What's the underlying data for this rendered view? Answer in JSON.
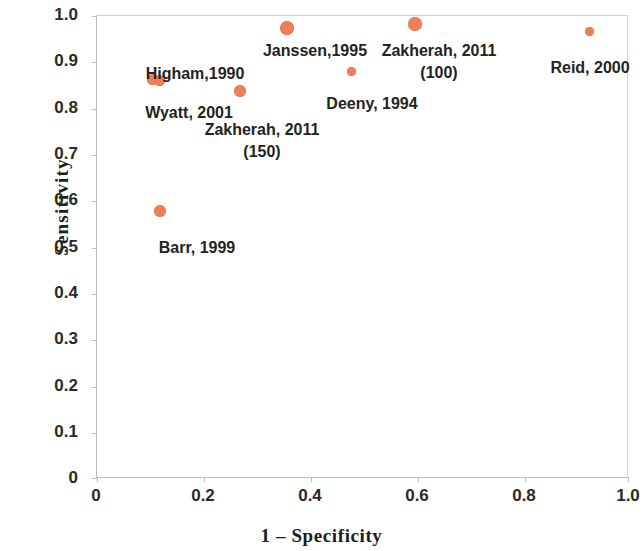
{
  "chart_data": {
    "type": "scatter",
    "title": "",
    "xlabel": "1 – Specificity",
    "ylabel": "Sensitivity",
    "xlim": [
      0,
      1.0
    ],
    "ylim": [
      0,
      1.0
    ],
    "grid": false,
    "legend": "none",
    "marker_color": "#ef7f57",
    "xticks": [
      "0",
      "0.2",
      "0.4",
      "0.6",
      "0.8",
      "1.0"
    ],
    "xtick_values": [
      0,
      0.2,
      0.4,
      0.6,
      0.8,
      1.0
    ],
    "yticks": [
      "0",
      "0.1",
      "0.2",
      "0.3",
      "0.4",
      "0.5",
      "0.6",
      "0.7",
      "0.8",
      "0.9",
      "1.0"
    ],
    "ytick_values": [
      0,
      0.1,
      0.2,
      0.3,
      0.4,
      0.5,
      0.6,
      0.7,
      0.8,
      0.9,
      1.0
    ],
    "points": [
      {
        "label": "Higham,1990",
        "x": 0.105,
        "y": 0.862,
        "size": 11
      },
      {
        "label": "Wyatt, 2001",
        "x": 0.118,
        "y": 0.86,
        "size": 11
      },
      {
        "label": "Barr, 1999",
        "x": 0.118,
        "y": 0.578,
        "size": 12
      },
      {
        "label": "Zakherah, 2011\n(150)",
        "x": 0.268,
        "y": 0.837,
        "size": 12
      },
      {
        "label": "Janssen,1995",
        "x": 0.358,
        "y": 0.975,
        "size": 14
      },
      {
        "label": "Deeny, 1994",
        "x": 0.478,
        "y": 0.88,
        "size": 9
      },
      {
        "label": "Zakherah, 2011\n(100)",
        "x": 0.597,
        "y": 0.983,
        "size": 14
      },
      {
        "label": "Reid, 2000",
        "x": 0.925,
        "y": 0.967,
        "size": 9
      }
    ]
  },
  "labels": {
    "higham": "Higham,1990",
    "wyatt": "Wyatt, 2001",
    "barr": "Barr, 1999",
    "zakherah150_line1": "Zakherah, 2011",
    "zakherah150_line2": "(150)",
    "janssen": "Janssen,1995",
    "deeny": "Deeny, 1994",
    "zakherah100_line1": "Zakherah, 2011",
    "zakherah100_line2": "(100)",
    "reid": "Reid, 2000"
  },
  "axes": {
    "y_title": "Sensitivity",
    "x_title": "1 – Specificity",
    "y_ticks": [
      "1.0",
      "0.9",
      "0.8",
      "0.7",
      "0.6",
      "0.5",
      "0.4",
      "0.3",
      "0.2",
      "0.1",
      "0"
    ],
    "x_ticks": [
      "0",
      "0.2",
      "0.4",
      "0.6",
      "0.8",
      "1.0"
    ]
  }
}
